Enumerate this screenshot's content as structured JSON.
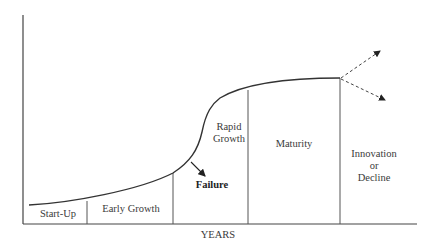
{
  "diagram": {
    "type": "business-life-cycle",
    "x_axis_label": "YEARS",
    "stages": [
      {
        "label": "Start-Up"
      },
      {
        "label": "Early Growth"
      },
      {
        "label": "Rapid\nGrowth",
        "line1": "Rapid",
        "line2": "Growth"
      },
      {
        "label": "Maturity"
      },
      {
        "label": "Innovation or Decline",
        "line1": "Innovation",
        "line2": "or",
        "line3": "Decline"
      }
    ],
    "failure_label": "Failure",
    "colors": {
      "line": "#333333",
      "background": "#ffffff"
    }
  }
}
